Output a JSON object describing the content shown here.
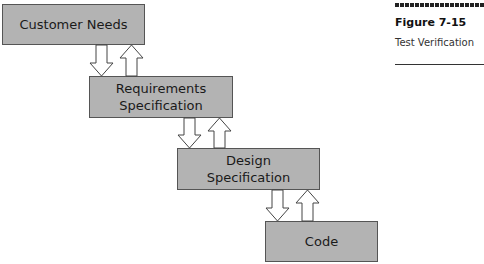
{
  "figure": {
    "label": "Figure 7-15",
    "caption": "Test Verification"
  },
  "boxes": [
    {
      "lines": [
        "Customer Needs"
      ]
    },
    {
      "lines": [
        "Requirements",
        "Specification"
      ]
    },
    {
      "lines": [
        "Design",
        "Specification"
      ]
    },
    {
      "lines": [
        "Code"
      ]
    }
  ],
  "colors": {
    "box_fill": "#b3b3b3",
    "box_border": "#555555",
    "arrow_fill": "#ffffff",
    "arrow_stroke": "#444444"
  }
}
